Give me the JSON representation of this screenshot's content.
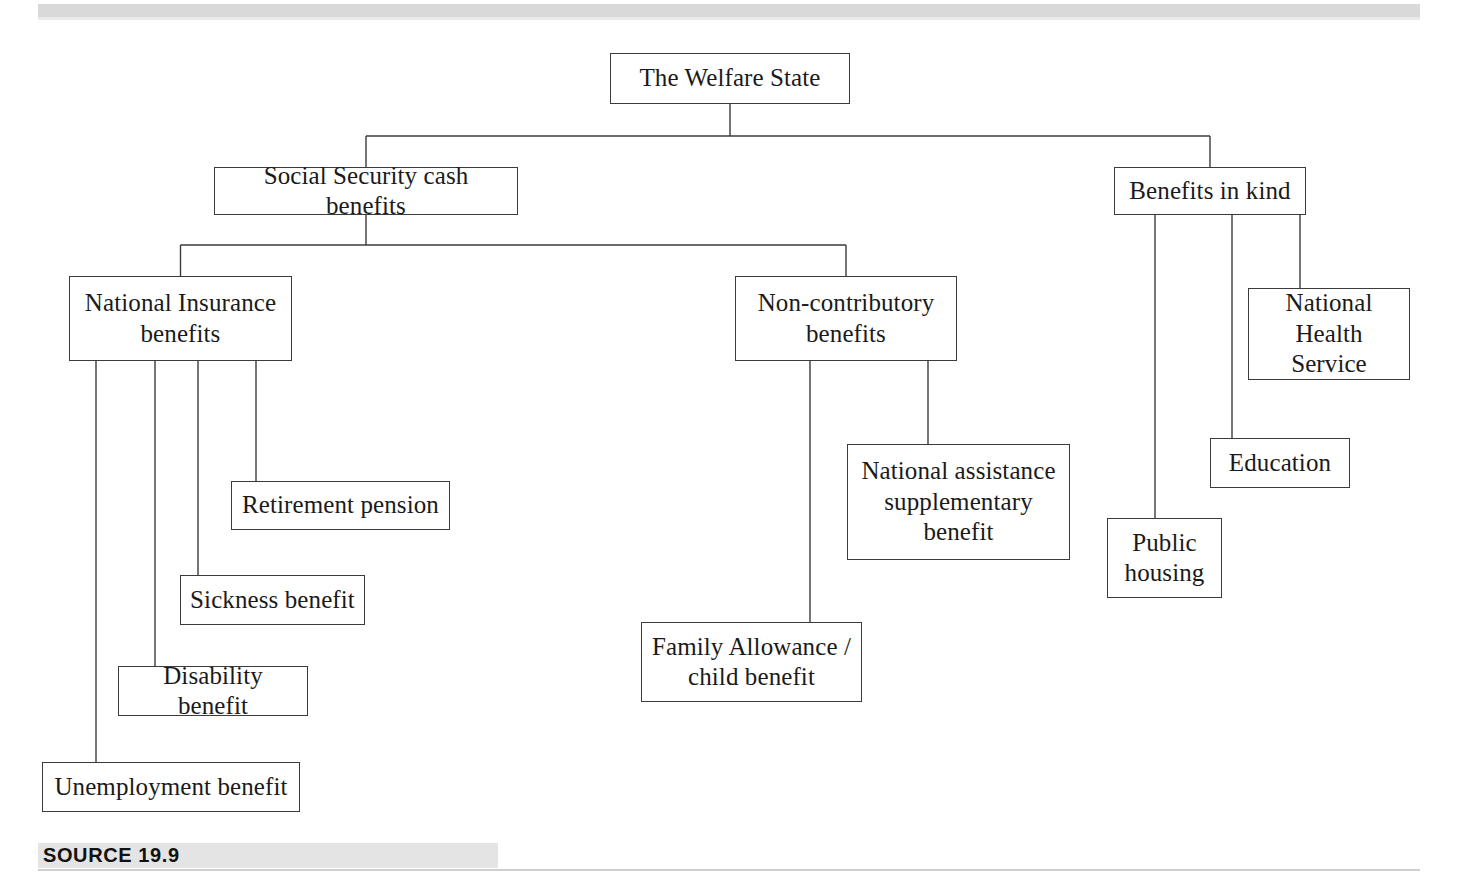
{
  "document": {
    "source_caption": "SOURCE 19.9",
    "title": "The Welfare State"
  },
  "style": {
    "box_border_color": "#3b3b3b",
    "connector_color": "#3b3b3b",
    "band_color": "#d9d9d9",
    "source_band_color": "#e4e4e4",
    "text_color": "#1a1a1a",
    "background": "#ffffff"
  },
  "chart_data": {
    "type": "diagram",
    "subtype": "organization-tree",
    "title": "The Welfare State",
    "orientation": "top-down",
    "nodes": [
      {
        "id": "root",
        "label": "The Welfare State",
        "level": 0,
        "x": 610,
        "y": 53,
        "w": 240,
        "h": 51
      },
      {
        "id": "cash",
        "label": "Social Security cash benefits",
        "level": 1,
        "x": 214,
        "y": 167,
        "w": 304,
        "h": 48
      },
      {
        "id": "kind",
        "label": "Benefits in kind",
        "level": 1,
        "x": 1114,
        "y": 167,
        "w": 192,
        "h": 48
      },
      {
        "id": "ni",
        "label": "National Insurance\nbenefits",
        "level": 2,
        "x": 69,
        "y": 276,
        "w": 223,
        "h": 85
      },
      {
        "id": "noncontrib",
        "label": "Non-contributory\nbenefits",
        "level": 2,
        "x": 735,
        "y": 276,
        "w": 222,
        "h": 85
      },
      {
        "id": "retirement",
        "label": "Retirement pension",
        "level": 3,
        "x": 231,
        "y": 481,
        "w": 219,
        "h": 49
      },
      {
        "id": "sickness",
        "label": "Sickness benefit",
        "level": 3,
        "x": 180,
        "y": 575,
        "w": 185,
        "h": 50
      },
      {
        "id": "disability",
        "label": "Disability benefit",
        "level": 3,
        "x": 118,
        "y": 666,
        "w": 190,
        "h": 50
      },
      {
        "id": "unemployment",
        "label": "Unemployment benefit",
        "level": 3,
        "x": 42,
        "y": 762,
        "w": 258,
        "h": 50
      },
      {
        "id": "natassist",
        "label": "National assistance\nsupplementary\nbenefit",
        "level": 3,
        "x": 847,
        "y": 444,
        "w": 223,
        "h": 116
      },
      {
        "id": "family",
        "label": "Family Allowance /\nchild benefit",
        "level": 3,
        "x": 641,
        "y": 622,
        "w": 221,
        "h": 80
      },
      {
        "id": "nhs",
        "label": "National\nHealth Service",
        "level": 2,
        "x": 1248,
        "y": 288,
        "w": 162,
        "h": 92
      },
      {
        "id": "education",
        "label": "Education",
        "level": 2,
        "x": 1210,
        "y": 438,
        "w": 140,
        "h": 50
      },
      {
        "id": "publichousing",
        "label": "Public\nhousing",
        "level": 2,
        "x": 1107,
        "y": 518,
        "w": 115,
        "h": 80
      }
    ],
    "edges": [
      {
        "from": "root",
        "to": "cash"
      },
      {
        "from": "root",
        "to": "kind"
      },
      {
        "from": "cash",
        "to": "ni"
      },
      {
        "from": "cash",
        "to": "noncontrib"
      },
      {
        "from": "ni",
        "to": "retirement"
      },
      {
        "from": "ni",
        "to": "sickness"
      },
      {
        "from": "ni",
        "to": "disability"
      },
      {
        "from": "ni",
        "to": "unemployment"
      },
      {
        "from": "noncontrib",
        "to": "natassist"
      },
      {
        "from": "noncontrib",
        "to": "family"
      },
      {
        "from": "kind",
        "to": "nhs"
      },
      {
        "from": "kind",
        "to": "education"
      },
      {
        "from": "kind",
        "to": "publichousing"
      }
    ]
  }
}
